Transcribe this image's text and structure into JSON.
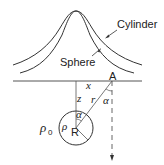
{
  "diagram": {
    "curves": {
      "cylinder_label": "Cylinder",
      "sphere_label": "Sphere"
    },
    "labels": {
      "point": "A",
      "x": "x",
      "z": "z",
      "r": "r",
      "alpha_top": "α",
      "alpha_center": "α",
      "rho_outer": "ρ",
      "rho_outer_sub": "0",
      "rho_inner": "ρ",
      "radius": "R"
    },
    "colors": {
      "stroke": "#333333",
      "background": "#ffffff"
    }
  }
}
